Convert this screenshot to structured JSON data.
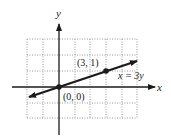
{
  "diagram": {
    "type": "coordinate-graph",
    "axes": {
      "x_label": "x",
      "y_label": "y"
    },
    "grid": {
      "x_min": -2,
      "x_max": 5,
      "y_min": -2,
      "y_max": 3,
      "style": "dotted"
    },
    "line": {
      "equation_label": "x = 3y",
      "slope": "1/3",
      "passes_through": [
        [
          0,
          0
        ],
        [
          3,
          1
        ]
      ]
    },
    "points": [
      {
        "label": "(0, 0)",
        "x": 0,
        "y": 0
      },
      {
        "label": "(3, 1)",
        "x": 3,
        "y": 1
      }
    ],
    "colors": {
      "line": "#1a1a1a",
      "grid": "#9a9a9a",
      "axis": "#1a1a1a"
    }
  }
}
